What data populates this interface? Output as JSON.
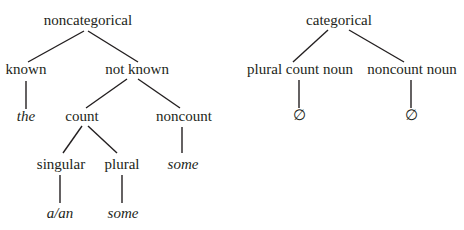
{
  "trees": [
    {
      "root": "noncategorical",
      "nodes": {
        "root": {
          "label": "noncategorical",
          "x": 88,
          "y": 14
        },
        "known": {
          "label": "known",
          "x": 26,
          "y": 62
        },
        "not_known": {
          "label": "not known",
          "x": 137,
          "y": 62
        },
        "the": {
          "label": "the",
          "x": 26,
          "y": 108,
          "italic": true
        },
        "count": {
          "label": "count",
          "x": 82,
          "y": 108
        },
        "noncount": {
          "label": "noncount",
          "x": 184,
          "y": 108
        },
        "singular": {
          "label": "singular",
          "x": 61,
          "y": 157
        },
        "plural": {
          "label": "plural",
          "x": 122,
          "y": 157
        },
        "noncount_some": {
          "label": "some",
          "x": 183,
          "y": 157,
          "italic": true
        },
        "a_an": {
          "label": "a/an",
          "x": 60,
          "y": 205,
          "italic": true
        },
        "plural_some": {
          "label": "some",
          "x": 123,
          "y": 205,
          "italic": true
        }
      }
    },
    {
      "root": "categorical",
      "nodes": {
        "root": {
          "label": "categorical",
          "x": 339,
          "y": 14
        },
        "plural_count_noun": {
          "label": "plural count noun",
          "x": 300,
          "y": 62
        },
        "noncount_noun": {
          "label": "noncount noun",
          "x": 412,
          "y": 62
        },
        "empty1": {
          "label": "∅",
          "x": 299,
          "y": 108
        },
        "empty2": {
          "label": "∅",
          "x": 411,
          "y": 108
        }
      }
    }
  ]
}
